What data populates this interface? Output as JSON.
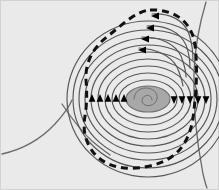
{
  "figure": {
    "canvas": {
      "width": 219,
      "height": 190
    },
    "colors": {
      "background": "#eaeaea",
      "frame_border": "#d2d2d2",
      "streamline": "#555555",
      "boundary_dashed": "#111111",
      "core_fill": "#a8a8a8",
      "core_stroke": "#6e6e6e",
      "terrain_line": "#6a6a6a",
      "arrow": "#000000"
    }
  },
  "background": {
    "name": "plot-field-background",
    "fill": "#eaeaea"
  },
  "terrain": {
    "label": "terrain profile outlines",
    "curves": [
      {
        "name": "terrain-valley-left",
        "path": "M 2,154 C 20,150 40,140 55,124 C 65,113 70,105 72,100"
      },
      {
        "name": "terrain-valley-right",
        "path": "M 62,104 C 70,116 80,130 92,141 C 100,148 106,152 110,155"
      },
      {
        "name": "terrain-body-right",
        "path": "M 206,2 C 200,22 195,46 194,72 C 193,104 196,138 203,174 C 205,182 206,186 207,188"
      }
    ]
  },
  "core": {
    "name": "vortex-core",
    "center": {
      "x": 148,
      "y": 99
    },
    "rx": 22,
    "ry": 13,
    "fill": "#a8a8a8",
    "spiral_path": "M 152,100 C 152,96 148,94 145,96 C 141,98 141,103 145,105 C 150,107 156,104 157,99 C 158,93 153,88 146,88 C 139,88 134,93 134,99"
  },
  "streamlines": {
    "label": "concentric streamline contours",
    "count": 9,
    "center": {
      "x": 148,
      "y": 99
    },
    "rings": [
      {
        "name": "streamline-ring-1",
        "rx": 29,
        "ry": 19
      },
      {
        "name": "streamline-ring-2",
        "rx": 36,
        "ry": 26
      },
      {
        "name": "streamline-ring-3",
        "rx": 43,
        "ry": 33
      },
      {
        "name": "streamline-ring-4",
        "rx": 50,
        "ry": 40
      },
      {
        "name": "streamline-ring-5",
        "rx": 57,
        "ry": 47
      },
      {
        "name": "streamline-ring-6",
        "rx": 63,
        "ry": 54
      },
      {
        "name": "streamline-ring-7",
        "rx": 69,
        "ry": 61
      },
      {
        "name": "streamline-ring-8",
        "rx": 75,
        "ry": 69
      },
      {
        "name": "streamline-ring-9",
        "rx": 81,
        "ry": 78
      }
    ]
  },
  "boundary": {
    "name": "dashed-boundary-curve",
    "style": "dashed",
    "dash_pattern": "7 5",
    "stroke_width": 3,
    "path": "M 150,10 C 175,9 192,22 195,45 C 198,70 196,96 193,118 C 189,144 176,160 150,166 C 124,172 104,166 93,152 C 84,140 83,128 85,116 C 87,104 87,92 86,80 C 85,64 92,48 108,36 C 122,25 136,11 150,10 Z"
  },
  "arrows": {
    "label": "flow direction markers",
    "horizontal_left": {
      "name": "arrow-group-left-up",
      "direction": "up",
      "y": 99,
      "xs": [
        92,
        100,
        108,
        116,
        124
      ]
    },
    "horizontal_right": {
      "name": "arrow-group-right-down",
      "direction": "down",
      "y": 99,
      "xs": [
        174,
        182,
        190,
        198,
        206
      ]
    },
    "top_arcs": {
      "name": "arrow-group-top-left",
      "direction": "left",
      "points": [
        {
          "x": 156,
          "y": 16
        },
        {
          "x": 151,
          "y": 28
        },
        {
          "x": 146,
          "y": 39
        },
        {
          "x": 143,
          "y": 50
        }
      ]
    }
  },
  "top_arcs": {
    "label": "upper outflow arcs",
    "paths": [
      {
        "name": "outflow-arc-1",
        "path": "M 152,14 C 170,13 184,20 189,34 C 192,43 193,52 193,60"
      },
      {
        "name": "outflow-arc-2",
        "path": "M 147,26 C 166,25 180,32 186,45 C 189,53 190,61 190,68"
      },
      {
        "name": "outflow-arc-3",
        "path": "M 142,37 C 161,37 175,44 181,56 C 184,64 186,71 186,77"
      },
      {
        "name": "outflow-arc-4",
        "path": "M 139,48 C 157,49 171,56 177,67 C 180,74 182,80 183,86"
      }
    ]
  }
}
